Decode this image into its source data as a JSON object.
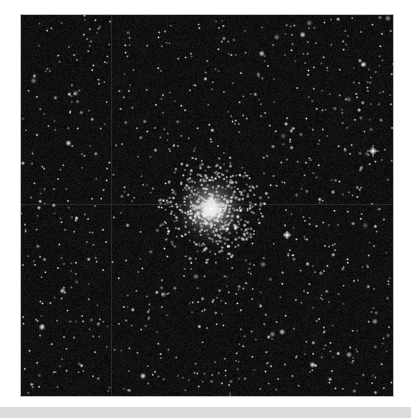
{
  "image": {
    "subject": "Globular star cluster in a dense star field",
    "alt": "Black-and-white telescope image of a globular star cluster surrounded by many field stars",
    "colors": {
      "sky": "#0b0b0b",
      "star": "#ffffff",
      "page_background": "#ffffff",
      "bottom_bar": "#dcdcdc"
    }
  }
}
